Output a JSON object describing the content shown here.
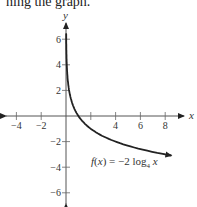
{
  "header": {
    "text": "ning the graph."
  },
  "chart_data": {
    "type": "line",
    "title": "",
    "xlabel": "x",
    "ylabel": "y",
    "xlim": [
      -5,
      9
    ],
    "ylim": [
      -7,
      7
    ],
    "grid": false,
    "x_ticks": [
      -4,
      -2,
      2,
      4,
      6,
      8
    ],
    "x_tick_labels": [
      "-4",
      "-2",
      "",
      "4",
      "6",
      "8"
    ],
    "y_ticks": [
      -6,
      -4,
      -2,
      2,
      4,
      6
    ],
    "y_tick_labels": [
      "−6",
      "−4",
      "−2",
      "2",
      "4",
      "6"
    ],
    "series": [
      {
        "name": "f(x) = -2 log4 x",
        "function": "-2*log4(x)",
        "x": [
          0.03,
          0.1,
          0.25,
          0.5,
          1,
          2,
          4,
          6,
          8
        ],
        "y": [
          5.06,
          3.32,
          2.0,
          1.0,
          0,
          -1.0,
          -2.0,
          -2.58,
          -3.0
        ]
      }
    ],
    "annotations": [
      {
        "text": "f(x) = −2 log",
        "subscript": "4",
        "suffix": " x",
        "x": 2.2,
        "y": -3.8
      }
    ]
  }
}
